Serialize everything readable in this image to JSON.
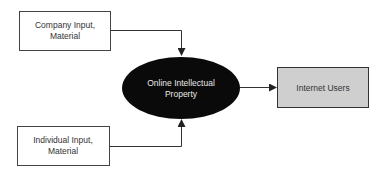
{
  "diagram": {
    "nodes": {
      "company": {
        "line1": "Company Input,",
        "line2": "Material"
      },
      "individual": {
        "line1": "Individual Input,",
        "line2": "Material"
      },
      "center": {
        "line1": "Online Intellectual",
        "line2": "Property"
      },
      "users": {
        "label": "Internet Users"
      }
    },
    "edges": [
      {
        "from": "company",
        "to": "center"
      },
      {
        "from": "individual",
        "to": "center"
      },
      {
        "from": "center",
        "to": "users"
      }
    ],
    "colors": {
      "ellipse": "#0a0a0a",
      "users_box": "#cfcfcf",
      "stroke": "#333333"
    }
  }
}
